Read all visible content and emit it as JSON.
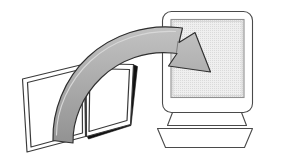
{
  "illustration": {
    "title": "Book to computer transfer illustration",
    "alt_text": "An open book with a large curved gray arrow sweeping up and to the right, pointing into the screen of a desktop computer monitor",
    "style": "black-and-white line art clipart with gray halftone shading",
    "background_color": "#ffffff",
    "canvas": {
      "width": 284,
      "height": 163
    }
  },
  "objects": {
    "book": {
      "name": "open-book",
      "description": "Open book tilted counter-clockwise, two facing pages meeting at a center gutter",
      "parts": [
        {
          "name": "left-page",
          "fill": "#ffffff",
          "outline": "#3a3a3a"
        },
        {
          "name": "right-page",
          "fill": "#ffffff",
          "outline": "#3a3a3a"
        },
        {
          "name": "page-edge-shadow",
          "fill": "#111111"
        },
        {
          "name": "center-gutter",
          "outline": "#3a3a3a"
        }
      ]
    },
    "arrow": {
      "name": "curved-transfer-arrow",
      "description": "Wide tapering ribbon arrow curving from the book up and over to the monitor screen",
      "direction": "book to monitor",
      "fill": "#a6a6a6",
      "outline": "#2f2f2f",
      "head_points": "down-right"
    },
    "monitor": {
      "name": "crt-monitor",
      "description": "CRT desktop monitor with rounded bezel, inset screen, neck and trapezoid base",
      "parts": [
        {
          "name": "monitor-bezel",
          "fill": "#ffffff",
          "outline": "#4a4a4a"
        },
        {
          "name": "monitor-screen",
          "fill": "#e8e8e8",
          "outline": "#8a8a8a"
        },
        {
          "name": "monitor-neck",
          "fill": "#ffffff",
          "outline": "#4a4a4a"
        },
        {
          "name": "monitor-base",
          "fill": "#ffffff",
          "outline": "#4a4a4a"
        }
      ]
    }
  },
  "colors": {
    "ink": "#4a4a4a",
    "ink_dark": "#2f2f2f",
    "arrow_gray": "#a6a6a6",
    "screen_gray": "#e8e8e8",
    "shadow_black": "#111111",
    "paper_white": "#ffffff"
  }
}
